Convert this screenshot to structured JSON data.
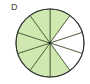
{
  "label": "D",
  "fraction_diagram": {
    "total_slices": 10,
    "shaded_slices": [
      0,
      4,
      5,
      6,
      7,
      8,
      9
    ],
    "shaded_count": 7,
    "center": [
      50,
      43
    ],
    "radius": 34,
    "colors": {
      "shaded": "#cfe8b0",
      "unshaded": "#ffffff",
      "outline": "#333333",
      "divider": "#4a5a3a"
    }
  }
}
